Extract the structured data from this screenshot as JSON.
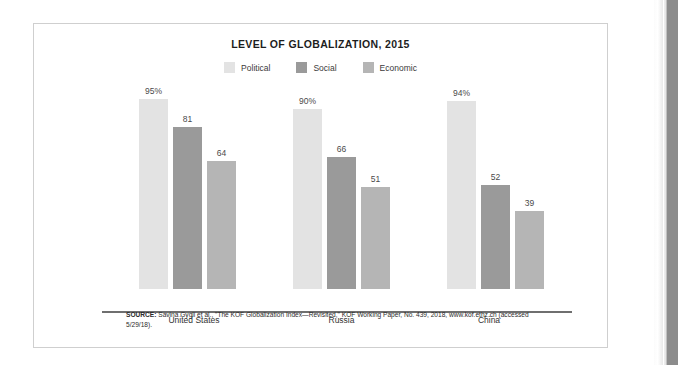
{
  "figure": {
    "title": "LEVEL OF GLOBALIZATION, 2015",
    "source_prefix": "SOURCE:",
    "source_text": " Savina Gygli et al., \"The KOF Globalization Index—Revisited,\" KOF Working Paper, No. 439, 2018, www.kof.ethz.ch (accessed 5/29/18)."
  },
  "colors": {
    "political": "#e3e3e3",
    "social": "#9a9a9a",
    "economic": "#b5b5b5",
    "axis": "#6f6f6f",
    "card_border": "#cfcfcf",
    "page_edge": "#8c8c8c"
  },
  "chart_data": {
    "type": "bar",
    "title": "LEVEL OF GLOBALIZATION, 2015",
    "xlabel": "",
    "ylabel": "",
    "ylim": [
      0,
      100
    ],
    "grid": false,
    "legend_position": "top-center",
    "categories": [
      "United States",
      "Russia",
      "China"
    ],
    "series": [
      {
        "name": "Political",
        "color": "#e3e3e3",
        "values": [
          95,
          90,
          94
        ],
        "labels": [
          "95%",
          "90%",
          "94%"
        ]
      },
      {
        "name": "Social",
        "color": "#9a9a9a",
        "values": [
          81,
          66,
          52
        ],
        "labels": [
          "81",
          "66",
          "52"
        ]
      },
      {
        "name": "Economic",
        "color": "#b5b5b5",
        "values": [
          64,
          51,
          39
        ],
        "labels": [
          "64",
          "51",
          "39"
        ]
      }
    ]
  }
}
